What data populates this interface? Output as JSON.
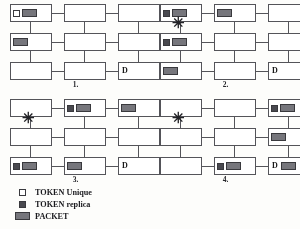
{
  "figure": {
    "panels": [
      {
        "caption": "1.",
        "star": false,
        "nodes": [
          {
            "row": 0,
            "col": 0,
            "items": [
              "token-unique",
              "packet"
            ],
            "label": ""
          },
          {
            "row": 0,
            "col": 1,
            "items": [],
            "label": ""
          },
          {
            "row": 0,
            "col": 2,
            "items": [],
            "label": ""
          },
          {
            "row": 1,
            "col": 0,
            "items": [
              "packet"
            ],
            "label": ""
          },
          {
            "row": 1,
            "col": 1,
            "items": [],
            "label": ""
          },
          {
            "row": 1,
            "col": 2,
            "items": [],
            "label": ""
          },
          {
            "row": 2,
            "col": 0,
            "items": [],
            "label": ""
          },
          {
            "row": 2,
            "col": 1,
            "items": [],
            "label": ""
          },
          {
            "row": 2,
            "col": 2,
            "items": [],
            "label": "D"
          }
        ]
      },
      {
        "caption": "2.",
        "star": true,
        "nodes": [
          {
            "row": 0,
            "col": 0,
            "items": [
              "token-replica",
              "packet"
            ],
            "label": ""
          },
          {
            "row": 0,
            "col": 1,
            "items": [
              "packet"
            ],
            "label": ""
          },
          {
            "row": 0,
            "col": 2,
            "items": [],
            "label": ""
          },
          {
            "row": 1,
            "col": 0,
            "items": [
              "token-replica",
              "packet"
            ],
            "label": ""
          },
          {
            "row": 1,
            "col": 1,
            "items": [],
            "label": ""
          },
          {
            "row": 1,
            "col": 2,
            "items": [],
            "label": ""
          },
          {
            "row": 2,
            "col": 0,
            "items": [
              "packet"
            ],
            "label": ""
          },
          {
            "row": 2,
            "col": 1,
            "items": [],
            "label": ""
          },
          {
            "row": 2,
            "col": 2,
            "items": [],
            "label": "D"
          }
        ]
      },
      {
        "caption": "3.",
        "star": true,
        "nodes": [
          {
            "row": 0,
            "col": 0,
            "items": [],
            "label": ""
          },
          {
            "row": 0,
            "col": 1,
            "items": [
              "token-replica",
              "packet"
            ],
            "label": ""
          },
          {
            "row": 0,
            "col": 2,
            "items": [
              "packet"
            ],
            "label": ""
          },
          {
            "row": 1,
            "col": 0,
            "items": [],
            "label": ""
          },
          {
            "row": 1,
            "col": 1,
            "items": [],
            "label": ""
          },
          {
            "row": 1,
            "col": 2,
            "items": [],
            "label": ""
          },
          {
            "row": 2,
            "col": 0,
            "items": [
              "token-replica",
              "packet"
            ],
            "label": ""
          },
          {
            "row": 2,
            "col": 1,
            "items": [
              "packet"
            ],
            "label": ""
          },
          {
            "row": 2,
            "col": 2,
            "items": [],
            "label": "D"
          }
        ]
      },
      {
        "caption": "4.",
        "star": true,
        "nodes": [
          {
            "row": 0,
            "col": 0,
            "items": [],
            "label": ""
          },
          {
            "row": 0,
            "col": 1,
            "items": [],
            "label": ""
          },
          {
            "row": 0,
            "col": 2,
            "items": [
              "token-replica",
              "packet"
            ],
            "label": ""
          },
          {
            "row": 1,
            "col": 0,
            "items": [],
            "label": ""
          },
          {
            "row": 1,
            "col": 1,
            "items": [],
            "label": ""
          },
          {
            "row": 1,
            "col": 2,
            "items": [
              "packet"
            ],
            "label": ""
          },
          {
            "row": 2,
            "col": 0,
            "items": [],
            "label": ""
          },
          {
            "row": 2,
            "col": 1,
            "items": [
              "token-replica",
              "packet"
            ],
            "label": ""
          },
          {
            "row": 2,
            "col": 2,
            "items": [
              "packet"
            ],
            "label": "D"
          }
        ]
      }
    ],
    "star_glyph": "✳"
  },
  "legend": {
    "items": [
      {
        "symbol": "token-unique",
        "label": "TOKEN Unique"
      },
      {
        "symbol": "token-replica",
        "label": "TOKEN replica"
      },
      {
        "symbol": "packet",
        "label": "PACKET"
      }
    ]
  },
  "colors": {
    "outline": "#55555a",
    "packet_fill": "#76767c",
    "replica_fill": "#4a4a50",
    "unique_fill": "#ffffff",
    "background": "#fdfdfb"
  }
}
